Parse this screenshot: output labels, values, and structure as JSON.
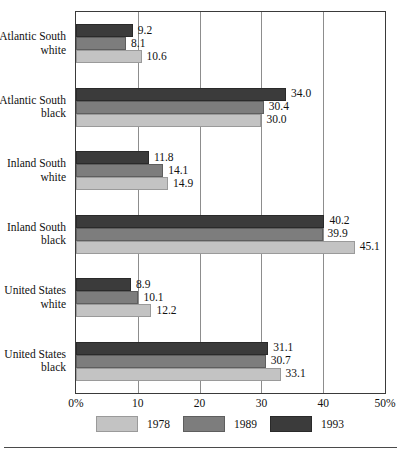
{
  "chart_data": {
    "type": "bar",
    "orientation": "horizontal",
    "title": "",
    "subtitle": "",
    "xlabel": "",
    "ylabel": "",
    "xlim": [
      0,
      50
    ],
    "xticks": [
      0,
      10,
      20,
      30,
      40,
      50
    ],
    "xticklabels": [
      "0%",
      "10",
      "20",
      "30",
      "40",
      "50%"
    ],
    "grid": true,
    "grid_axis": "x",
    "legend_position": "bottom",
    "categories": [
      "Atlantic South white",
      "Atlantic South black",
      "Inland South white",
      "Inland South black",
      "United States white",
      "United States black"
    ],
    "category_lines": [
      [
        "Atlantic South",
        "white"
      ],
      [
        "Atlantic South",
        "black"
      ],
      [
        "Inland South",
        "white"
      ],
      [
        "Inland South",
        "black"
      ],
      [
        "United States",
        "white"
      ],
      [
        "United States",
        "black"
      ]
    ],
    "series": [
      {
        "name": "1993",
        "color": "#3b3b3b",
        "values": [
          9.2,
          34.0,
          11.8,
          40.2,
          8.9,
          31.1
        ],
        "labels": [
          "9.2",
          "34.0",
          "11.8",
          "40.2",
          "8.9",
          "31.1"
        ]
      },
      {
        "name": "1989",
        "color": "#7d7d7d",
        "values": [
          8.1,
          30.4,
          14.1,
          39.9,
          10.1,
          30.7
        ],
        "labels": [
          "8.1",
          "30.4",
          "14.1",
          "39.9",
          "10.1",
          "30.7"
        ]
      },
      {
        "name": "1978",
        "color": "#c3c3c3",
        "values": [
          10.6,
          30.0,
          14.9,
          45.1,
          12.2,
          33.1
        ],
        "labels": [
          "10.6",
          "30.0",
          "14.9",
          "45.1",
          "12.2",
          "33.1"
        ]
      }
    ],
    "series_order_top_to_bottom": [
      "1993",
      "1989",
      "1978"
    ],
    "legend": [
      {
        "label": "1978",
        "color": "#c3c3c3"
      },
      {
        "label": "1989",
        "color": "#7d7d7d"
      },
      {
        "label": "1993",
        "color": "#3b3b3b"
      }
    ]
  }
}
